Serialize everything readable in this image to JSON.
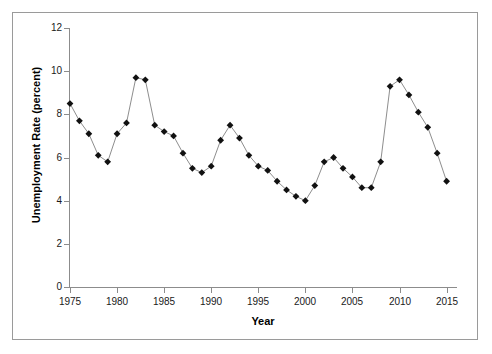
{
  "chart_data": {
    "type": "line",
    "title": "",
    "subtitle": "",
    "xlabel": "Year",
    "ylabel": "Unemployment Rate (percent)",
    "xlim": [
      1975,
      2016
    ],
    "ylim": [
      0,
      12
    ],
    "xticks": [
      1975,
      1980,
      1985,
      1990,
      1995,
      2000,
      2005,
      2010,
      2015
    ],
    "yticks": [
      0,
      2,
      4,
      6,
      8,
      10,
      12
    ],
    "grid": false,
    "legend": null,
    "marker": "filled-diamond",
    "marker_color": "#111111",
    "line_color": "#808080",
    "x": [
      1975,
      1976,
      1977,
      1978,
      1979,
      1980,
      1981,
      1982,
      1983,
      1984,
      1985,
      1986,
      1987,
      1988,
      1989,
      1990,
      1991,
      1992,
      1993,
      1994,
      1995,
      1996,
      1997,
      1998,
      1999,
      2000,
      2001,
      2002,
      2003,
      2004,
      2005,
      2006,
      2007,
      2008,
      2009,
      2010,
      2011,
      2012,
      2013,
      2014,
      2015
    ],
    "values": [
      8.5,
      7.7,
      7.1,
      6.1,
      5.8,
      7.1,
      7.6,
      9.7,
      9.6,
      7.5,
      7.2,
      7.0,
      6.2,
      5.5,
      5.3,
      5.6,
      6.8,
      7.5,
      6.9,
      6.1,
      5.6,
      5.4,
      4.9,
      4.5,
      4.2,
      4.0,
      4.7,
      5.8,
      6.0,
      5.5,
      5.1,
      4.6,
      4.6,
      5.8,
      9.3,
      9.6,
      8.9,
      8.1,
      7.4,
      6.2,
      4.9
    ],
    "series": [
      {
        "name": "Unemployment Rate",
        "values": [
          8.5,
          7.7,
          7.1,
          6.1,
          5.8,
          7.1,
          7.6,
          9.7,
          9.6,
          7.5,
          7.2,
          7.0,
          6.2,
          5.5,
          5.3,
          5.6,
          6.8,
          7.5,
          6.9,
          6.1,
          5.6,
          5.4,
          4.9,
          4.5,
          4.2,
          4.0,
          4.7,
          5.8,
          6.0,
          5.5,
          5.1,
          4.6,
          4.6,
          5.8,
          9.3,
          9.6,
          8.9,
          8.1,
          7.4,
          6.2,
          4.9
        ]
      }
    ]
  },
  "axes": {
    "y_tick_labels": [
      "12",
      "10",
      "8",
      "6",
      "4",
      "2",
      "0"
    ],
    "x_tick_labels": [
      "1975",
      "1980",
      "1985",
      "1990",
      "1995",
      "2000",
      "2005",
      "2010",
      "2015"
    ],
    "y_axis_title": "Unemployment Rate (percent)",
    "x_axis_title": "Year"
  },
  "colors": {
    "frame_border": "#9a9a9a",
    "axis": "#8c8c8c",
    "marker": "#111111",
    "line": "#808080",
    "text": "#1a1a1a",
    "background": "#ffffff"
  }
}
